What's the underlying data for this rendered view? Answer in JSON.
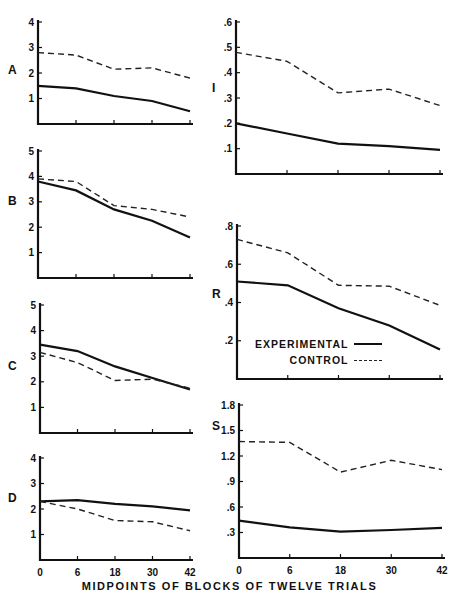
{
  "chart_data": {
    "type": "line",
    "title": "",
    "xlabel": "MIDPOINTS OF BLOCKS OF TWELVE TRIALS",
    "x": [
      0,
      6,
      18,
      30,
      42
    ],
    "x_tick_labels": [
      "0",
      "6",
      "18",
      "30",
      "42"
    ],
    "legend": [
      {
        "name": "EXPERIMENTAL",
        "style": "solid"
      },
      {
        "name": "CONTROL",
        "style": "dashed"
      }
    ],
    "panels": [
      {
        "label": "A",
        "column": "left",
        "ylim": [
          0,
          4
        ],
        "yticks": [
          "1",
          "2",
          "3",
          "4"
        ],
        "series": [
          {
            "name": "EXPERIMENTAL",
            "values": [
              1.5,
              1.4,
              1.1,
              0.9,
              0.5
            ]
          },
          {
            "name": "CONTROL",
            "values": [
              2.8,
              2.7,
              2.15,
              2.2,
              1.8
            ]
          }
        ]
      },
      {
        "label": "B",
        "column": "left",
        "ylim": [
          0,
          5
        ],
        "yticks": [
          "1",
          "2",
          "3",
          "4",
          "5"
        ],
        "series": [
          {
            "name": "EXPERIMENTAL",
            "values": [
              3.8,
              3.45,
              2.7,
              2.25,
              1.6
            ]
          },
          {
            "name": "CONTROL",
            "values": [
              3.9,
              3.8,
              2.85,
              2.7,
              2.4
            ]
          }
        ]
      },
      {
        "label": "C",
        "column": "left",
        "ylim": [
          0,
          5
        ],
        "yticks": [
          "1",
          "2",
          "3",
          "4",
          "5"
        ],
        "series": [
          {
            "name": "EXPERIMENTAL",
            "values": [
              3.45,
              3.2,
              2.6,
              2.15,
              1.7
            ]
          },
          {
            "name": "CONTROL",
            "values": [
              3.15,
              2.75,
              2.05,
              2.1,
              1.75
            ]
          }
        ]
      },
      {
        "label": "D",
        "column": "left",
        "ylim": [
          0,
          4
        ],
        "yticks": [
          "1",
          "2",
          "3",
          "4"
        ],
        "series": [
          {
            "name": "EXPERIMENTAL",
            "values": [
              2.3,
              2.35,
              2.2,
              2.1,
              1.95
            ]
          },
          {
            "name": "CONTROL",
            "values": [
              2.3,
              2.0,
              1.55,
              1.5,
              1.15
            ]
          }
        ]
      },
      {
        "label": "I",
        "column": "right",
        "ylim": [
          0,
          0.6
        ],
        "yticks": [
          ".1",
          ".2",
          ".3",
          ".4",
          ".5",
          ".6"
        ],
        "series": [
          {
            "name": "EXPERIMENTAL",
            "values": [
              0.2,
              0.16,
              0.12,
              0.11,
              0.095
            ]
          },
          {
            "name": "CONTROL",
            "values": [
              0.48,
              0.445,
              0.32,
              0.335,
              0.27
            ]
          }
        ]
      },
      {
        "label": "R",
        "column": "right",
        "ylim": [
          0,
          0.8
        ],
        "yticks": [
          ".2",
          ".4",
          ".6",
          ".8"
        ],
        "series": [
          {
            "name": "EXPERIMENTAL",
            "values": [
              0.51,
              0.49,
              0.37,
              0.28,
              0.155
            ]
          },
          {
            "name": "CONTROL",
            "values": [
              0.73,
              0.66,
              0.49,
              0.485,
              0.385
            ]
          }
        ]
      },
      {
        "label": "S",
        "column": "right",
        "ylim": [
          0,
          1.8
        ],
        "yticks": [
          ".3",
          ".6",
          ".9",
          "1.2",
          "1.5",
          "1.8"
        ],
        "series": [
          {
            "name": "EXPERIMENTAL",
            "values": [
              0.44,
              0.36,
              0.31,
              0.33,
              0.355
            ]
          },
          {
            "name": "CONTROL",
            "values": [
              1.37,
              1.36,
              1.01,
              1.15,
              1.04
            ]
          }
        ]
      }
    ]
  },
  "legend": {
    "experimental_label": "EXPERIMENTAL",
    "control_label": "CONTROL"
  },
  "xlabel": "MIDPOINTS OF BLOCKS OF TWELVE TRIALS"
}
